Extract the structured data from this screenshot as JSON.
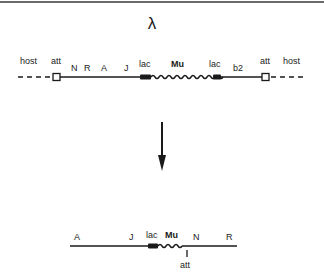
{
  "diagram": {
    "title": "λ",
    "top_map": {
      "labels": [
        {
          "id": "host-left",
          "text": "host",
          "x": 20,
          "y": 64
        },
        {
          "id": "att-left",
          "text": "att",
          "x": 51,
          "y": 64
        },
        {
          "id": "N",
          "text": "N",
          "x": 71,
          "y": 71
        },
        {
          "id": "R",
          "text": "R",
          "x": 86,
          "y": 71
        },
        {
          "id": "A",
          "text": "A",
          "x": 104,
          "y": 71
        },
        {
          "id": "J",
          "text": "J",
          "x": 126,
          "y": 71
        },
        {
          "id": "lac-left",
          "text": "lac",
          "x": 144,
          "y": 66
        },
        {
          "id": "Mu",
          "text": "Mu",
          "x": 176,
          "y": 66
        },
        {
          "id": "lac-right",
          "text": "lac",
          "x": 216,
          "y": 66
        },
        {
          "id": "b2",
          "text": "b2",
          "x": 240,
          "y": 71
        },
        {
          "id": "att-right",
          "text": "att",
          "x": 273,
          "y": 64
        },
        {
          "id": "host-right",
          "text": "host",
          "x": 296,
          "y": 64
        }
      ]
    },
    "arrow": {
      "direction": "down"
    },
    "bottom_map": {
      "labels": [
        {
          "id": "A",
          "text": "A",
          "x": 78,
          "y": 238
        },
        {
          "id": "J",
          "text": "J",
          "x": 132,
          "y": 238
        },
        {
          "id": "lac",
          "text": "lac",
          "x": 156,
          "y": 236
        },
        {
          "id": "Mu",
          "text": "Mu",
          "x": 180,
          "y": 236
        },
        {
          "id": "N",
          "text": "N",
          "x": 198,
          "y": 238
        },
        {
          "id": "R",
          "text": "R",
          "x": 229,
          "y": 238
        },
        {
          "id": "att",
          "text": "att",
          "x": 187,
          "y": 268
        }
      ]
    }
  }
}
